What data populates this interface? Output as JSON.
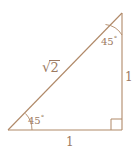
{
  "figure": {
    "name": "right-triangle-45-45-90",
    "stroke_color": "#b08968",
    "text_color": "#9c7a62",
    "background_color": "#ffffff",
    "geometry": {
      "vertex_bottom_left": [
        8,
        130
      ],
      "vertex_bottom_right": [
        122,
        130
      ],
      "vertex_top_right": [
        122,
        13
      ]
    },
    "labels": {
      "hypotenuse_radical": "√",
      "hypotenuse_radicand": "2",
      "leg_right": "1",
      "leg_bottom": "1",
      "angle_top_value": "45",
      "angle_top_degree": "°",
      "angle_bottom_value": "45",
      "angle_bottom_degree": "°"
    },
    "markers": {
      "right_angle_square": "right-angle-marker",
      "angle_arc_top": "angle-arc",
      "angle_arc_bottom": "angle-arc"
    }
  }
}
